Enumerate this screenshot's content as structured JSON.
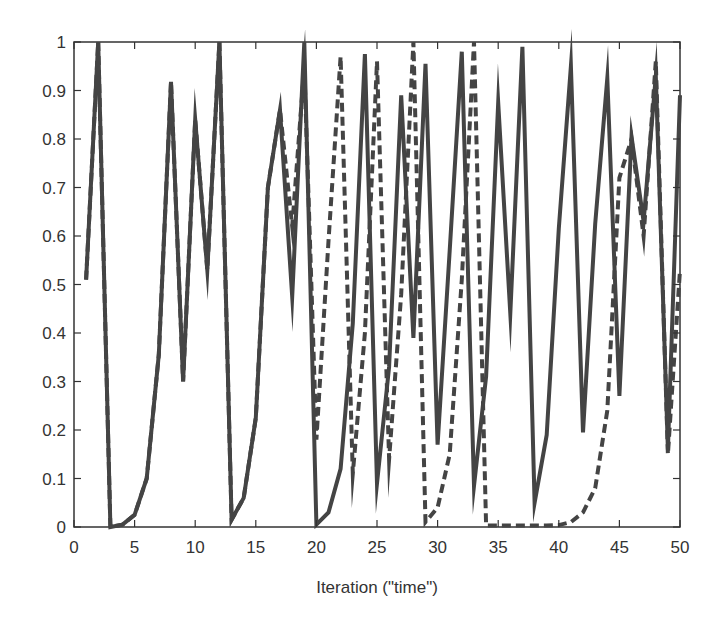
{
  "chart_data": {
    "type": "line",
    "title": "",
    "xlabel": "Iteration (\"time\")",
    "ylabel": "",
    "xlim": [
      0,
      50
    ],
    "ylim": [
      0,
      1
    ],
    "xticks": [
      0,
      5,
      10,
      15,
      20,
      25,
      30,
      35,
      40,
      45,
      50
    ],
    "xtick_labels": [
      "0",
      "5",
      "10",
      "15",
      "20",
      "25",
      "30",
      "35",
      "40",
      "45",
      "50"
    ],
    "yticks": [
      0,
      0.1,
      0.2,
      0.3,
      0.4,
      0.5,
      0.6,
      0.7,
      0.8,
      0.9,
      1
    ],
    "ytick_labels": [
      "0",
      "0.1",
      "0.2",
      "0.3",
      "0.4",
      "0.5",
      "0.6",
      "0.7",
      "0.8",
      "0.9",
      "1"
    ],
    "grid": false,
    "legend": null,
    "x": [
      1,
      2,
      3,
      4,
      5,
      6,
      7,
      8,
      9,
      10,
      11,
      12,
      13,
      14,
      15,
      16,
      17,
      18,
      19,
      20,
      21,
      22,
      23,
      24,
      25,
      26,
      27,
      28,
      29,
      30,
      31,
      32,
      33,
      34,
      35,
      36,
      37,
      38,
      39,
      40,
      41,
      42,
      43,
      44,
      45,
      46,
      47,
      48,
      49,
      50
    ],
    "series": [
      {
        "name": "solid",
        "style": "solid",
        "color": "#444444",
        "values": [
          0.51,
          1.0,
          0.0,
          0.005,
          0.025,
          0.1,
          0.355,
          0.918,
          0.3,
          0.84,
          0.53,
          1.0,
          0.015,
          0.06,
          0.225,
          0.7,
          0.86,
          0.475,
          1.0,
          0.005,
          0.03,
          0.12,
          0.42,
          0.975,
          0.09,
          0.33,
          0.89,
          0.39,
          0.955,
          0.17,
          0.57,
          0.98,
          0.085,
          0.31,
          0.875,
          0.44,
          0.99,
          0.05,
          0.19,
          0.615,
          0.95,
          0.195,
          0.625,
          0.925,
          0.27,
          0.805,
          0.63,
          0.93,
          0.16,
          0.89
        ]
      },
      {
        "name": "dashed",
        "style": "dashed",
        "color": "#444444",
        "values": [
          0.51,
          1.0,
          0.0,
          0.005,
          0.025,
          0.1,
          0.355,
          0.918,
          0.3,
          0.84,
          0.53,
          1.0,
          0.015,
          0.06,
          0.225,
          0.7,
          0.86,
          0.62,
          0.95,
          0.18,
          0.59,
          0.97,
          0.11,
          0.4,
          0.96,
          0.14,
          0.48,
          1.0,
          0.01,
          0.04,
          0.15,
          0.51,
          1.0,
          0.003,
          0.003,
          0.003,
          0.003,
          0.003,
          0.003,
          0.004,
          0.01,
          0.03,
          0.08,
          0.24,
          0.72,
          0.8,
          0.6,
          0.96,
          0.15,
          0.53
        ]
      }
    ]
  },
  "colors": {
    "line": "#444444",
    "axis": "#333333",
    "background": "#ffffff"
  }
}
